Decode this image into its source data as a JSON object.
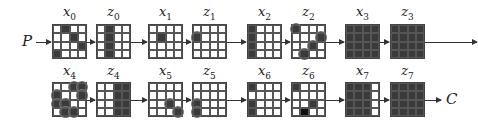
{
  "input_label": "P",
  "output_label": "C",
  "rows": [
    {
      "top": 24,
      "label_top": 4,
      "items": [
        {
          "name": "x",
          "sub": "0",
          "left": 52,
          "cells": [
            [
              0,
              1
            ],
            [
              1,
              2
            ],
            [
              2,
              3
            ],
            [
              3,
              0
            ]
          ],
          "circled": []
        },
        {
          "name": "z",
          "sub": "0",
          "left": 96,
          "cells": [
            [
              0,
              1
            ],
            [
              1,
              1
            ],
            [
              2,
              1
            ],
            [
              3,
              1
            ]
          ],
          "circled": []
        },
        {
          "name": "x",
          "sub": "1",
          "left": 148,
          "cells": [
            [
              1,
              1
            ]
          ],
          "circled": []
        },
        {
          "name": "z",
          "sub": "1",
          "left": 192,
          "cells": [
            [
              1,
              0
            ]
          ],
          "circled": [
            [
              1,
              0
            ]
          ]
        },
        {
          "name": "x",
          "sub": "2",
          "left": 247,
          "cells": [
            [
              0,
              0
            ],
            [
              1,
              0
            ],
            [
              2,
              0
            ],
            [
              3,
              0
            ]
          ],
          "circled": []
        },
        {
          "name": "z",
          "sub": "2",
          "left": 291,
          "cells": [
            [
              0,
              0
            ],
            [
              1,
              3
            ],
            [
              2,
              2
            ],
            [
              3,
              1
            ]
          ],
          "circled": [
            [
              0,
              0
            ],
            [
              1,
              3
            ],
            [
              2,
              2
            ],
            [
              3,
              1
            ]
          ]
        },
        {
          "name": "x",
          "sub": "3",
          "left": 345,
          "cells": "all",
          "circled": []
        },
        {
          "name": "z",
          "sub": "3",
          "left": 390,
          "cells": "all",
          "circled": []
        }
      ]
    },
    {
      "top": 82,
      "label_top": 63,
      "items": [
        {
          "name": "x",
          "sub": "4",
          "left": 52,
          "cells": [
            [
              0,
              2
            ],
            [
              0,
              3
            ],
            [
              1,
              0
            ],
            [
              1,
              3
            ],
            [
              2,
              0
            ],
            [
              2,
              1
            ],
            [
              3,
              1
            ],
            [
              3,
              2
            ]
          ],
          "circled": [
            [
              0,
              2
            ],
            [
              0,
              3
            ],
            [
              1,
              0
            ],
            [
              1,
              3
            ],
            [
              2,
              0
            ],
            [
              2,
              1
            ],
            [
              3,
              1
            ],
            [
              3,
              2
            ]
          ]
        },
        {
          "name": "z",
          "sub": "4",
          "left": 96,
          "cells": [
            [
              0,
              2
            ],
            [
              0,
              3
            ],
            [
              1,
              2
            ],
            [
              1,
              3
            ],
            [
              2,
              2
            ],
            [
              2,
              3
            ],
            [
              3,
              2
            ],
            [
              3,
              3
            ]
          ],
          "circled": []
        },
        {
          "name": "x",
          "sub": "5",
          "left": 148,
          "cells": [
            [
              2,
              2
            ],
            [
              3,
              3
            ]
          ],
          "circled": [
            [
              2,
              2
            ],
            [
              3,
              3
            ]
          ]
        },
        {
          "name": "z",
          "sub": "5",
          "left": 192,
          "cells": [
            [
              2,
              0
            ],
            [
              3,
              0
            ]
          ],
          "circled": [
            [
              2,
              0
            ],
            [
              3,
              0
            ]
          ]
        },
        {
          "name": "x",
          "sub": "6",
          "left": 247,
          "cells": [
            [
              0,
              0
            ],
            [
              2,
              0
            ],
            [
              3,
              0
            ]
          ],
          "circled": []
        },
        {
          "name": "z",
          "sub": "6",
          "left": 291,
          "cells": [
            [
              0,
              0
            ],
            [
              2,
              2
            ],
            [
              3,
              1
            ]
          ],
          "circled": [],
          "black": [
            [
              3,
              1
            ]
          ]
        },
        {
          "name": "x",
          "sub": "7",
          "left": 345,
          "cells": [
            [
              0,
              0
            ],
            [
              0,
              1
            ],
            [
              0,
              2
            ],
            [
              1,
              0
            ],
            [
              1,
              1
            ],
            [
              1,
              2
            ],
            [
              2,
              0
            ],
            [
              2,
              1
            ],
            [
              2,
              2
            ],
            [
              3,
              0
            ],
            [
              3,
              1
            ],
            [
              3,
              2
            ]
          ],
          "circled": []
        },
        {
          "name": "z",
          "sub": "7",
          "left": 390,
          "cells": "all",
          "circled": []
        }
      ]
    }
  ]
}
